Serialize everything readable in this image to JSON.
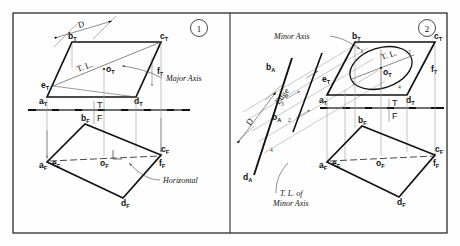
{
  "figure": {
    "border_color": "#2b2b2b",
    "line_color": "#111111",
    "thin_color": "#8a8a8a",
    "panels": [
      {
        "number": "1",
        "annotations": {
          "major_axis": "Major Axis",
          "horizontal": "Horizontal",
          "true_length": "T. L.",
          "diameter": "D",
          "fold_top": "T",
          "fold_front": "F"
        },
        "top_view_points": [
          "a",
          "b",
          "c",
          "d",
          "e",
          "f",
          "o"
        ],
        "front_view_points": [
          "a",
          "b",
          "c",
          "d",
          "e",
          "f",
          "o"
        ],
        "subscript_top": "T",
        "subscript_front": "F"
      },
      {
        "number": "2",
        "annotations": {
          "minor_axis": "Minor Axis",
          "tl_of_minor_axis_line1": "T. L. of",
          "tl_of_minor_axis_line2": "Minor Axis",
          "true_length": "T. L.",
          "diameter": "D",
          "edge": "Edge",
          "fold_top": "T",
          "fold_front": "F"
        },
        "ellipse_points": [
          "1",
          "2",
          "3",
          "4"
        ],
        "aux_points": [
          "2",
          "3",
          "4"
        ],
        "aux_labels": [
          "b",
          "d",
          "o"
        ],
        "subscript_aux": "A",
        "subscript_top": "T",
        "subscript_front": "F"
      }
    ]
  }
}
